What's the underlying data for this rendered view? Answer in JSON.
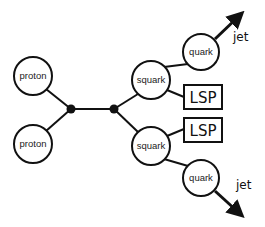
{
  "diagram": {
    "title": "",
    "nodes": {
      "proton_top": {
        "label": "proton"
      },
      "proton_bottom": {
        "label": "proton"
      },
      "squark_top": {
        "label": "squark"
      },
      "squark_bottom": {
        "label": "squark"
      },
      "quark_top": {
        "label": "quark"
      },
      "quark_bottom": {
        "label": "quark"
      },
      "lsp_top": {
        "label": "LSP"
      },
      "lsp_bottom": {
        "label": "LSP"
      }
    },
    "jets": {
      "top": {
        "label": "jet"
      },
      "bottom": {
        "label": "jet"
      }
    },
    "edges": [
      [
        "proton_top",
        "vertex_1"
      ],
      [
        "proton_bottom",
        "vertex_1"
      ],
      [
        "vertex_1",
        "vertex_2"
      ],
      [
        "vertex_2",
        "squark_top"
      ],
      [
        "vertex_2",
        "squark_bottom"
      ],
      [
        "squark_top",
        "quark_top"
      ],
      [
        "squark_top",
        "lsp_top"
      ],
      [
        "squark_bottom",
        "lsp_bottom"
      ],
      [
        "squark_bottom",
        "quark_bottom"
      ],
      [
        "quark_top",
        "jet_top"
      ],
      [
        "quark_bottom",
        "jet_bottom"
      ]
    ],
    "colors": {
      "stroke": "#111111",
      "background": "#ffffff"
    }
  }
}
